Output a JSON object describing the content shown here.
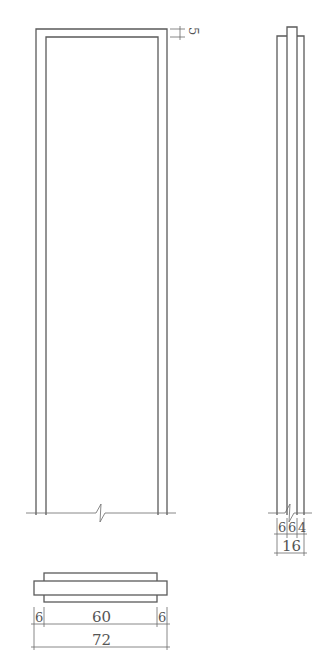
{
  "drawing": {
    "front_view": {
      "label": "door-frame-elevation",
      "top_dimension": "5"
    },
    "side_view": {
      "label": "door-frame-section",
      "dimensions": [
        "6",
        "6",
        "4"
      ],
      "total": "16"
    },
    "plan_view": {
      "label": "door-frame-plan",
      "dimensions": [
        "6",
        "60",
        "6"
      ],
      "total": "72"
    },
    "colors": {
      "line": "#5a5a5a",
      "background": "#ffffff"
    }
  }
}
